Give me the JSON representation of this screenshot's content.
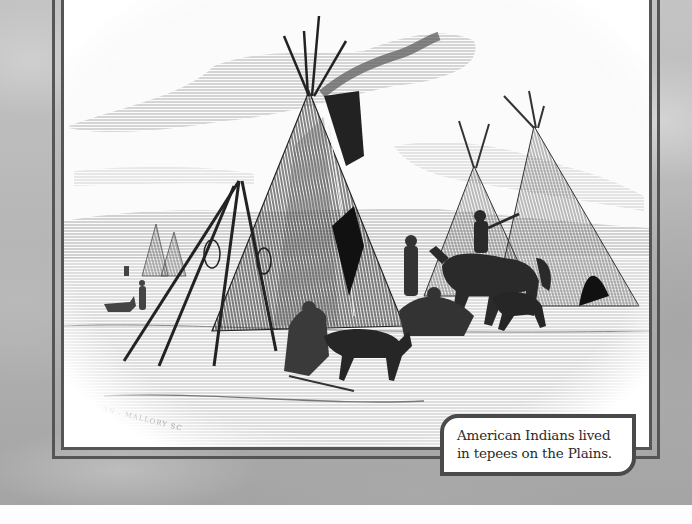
{
  "figure": {
    "engraver_signature": "KILBURN - MALLORY SC",
    "colors": {
      "frame_line": "#555555",
      "caption_border": "#4a4a4a",
      "background_texture": "#b5b5b5",
      "illustration_paper": "#fbfbfb"
    }
  },
  "caption": {
    "line1": "American Indians lived",
    "line2": "in tepees on the Plains."
  }
}
